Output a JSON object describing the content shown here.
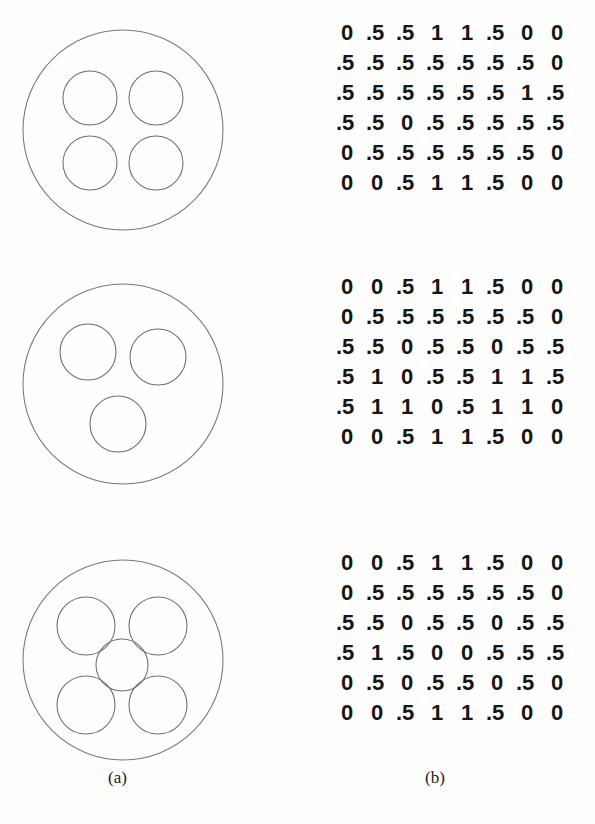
{
  "figure": {
    "caption_a": "(a)",
    "caption_b": "(b)",
    "stroke_color": "#6d6d70",
    "text_color": "#161616",
    "background": "#ffffff"
  },
  "panels": [
    {
      "id": "panel-1",
      "diagram": {
        "name": "four-circle-packing",
        "outer": {
          "cx": 105,
          "cy": 112,
          "r": 100
        },
        "inner": [
          {
            "cx": 72,
            "cy": 80,
            "r": 27
          },
          {
            "cx": 138,
            "cy": 80,
            "r": 27
          },
          {
            "cx": 72,
            "cy": 145,
            "r": 27
          },
          {
            "cx": 138,
            "cy": 145,
            "r": 27
          }
        ],
        "inner_count": 4
      },
      "matrix": [
        [
          "0",
          ".5",
          ".5",
          "1",
          "1",
          ".5",
          "0",
          "0"
        ],
        [
          ".5",
          ".5",
          ".5",
          ".5",
          ".5",
          ".5",
          ".5",
          "0"
        ],
        [
          ".5",
          ".5",
          ".5",
          ".5",
          ".5",
          ".5",
          "1",
          ".5"
        ],
        [
          ".5",
          ".5",
          "0",
          ".5",
          ".5",
          ".5",
          ".5",
          ".5"
        ],
        [
          "0",
          ".5",
          ".5",
          ".5",
          ".5",
          ".5",
          ".5",
          "0"
        ],
        [
          "0",
          "0",
          ".5",
          "1",
          "1",
          ".5",
          "0",
          "0"
        ]
      ]
    },
    {
      "id": "panel-2",
      "diagram": {
        "name": "three-circle-packing",
        "outer": {
          "cx": 105,
          "cy": 112,
          "r": 100
        },
        "inner": [
          {
            "cx": 70,
            "cy": 80,
            "r": 28
          },
          {
            "cx": 140,
            "cy": 85,
            "r": 28
          },
          {
            "cx": 100,
            "cy": 152,
            "r": 28
          }
        ],
        "inner_count": 3
      },
      "matrix": [
        [
          "0",
          "0",
          ".5",
          "1",
          "1",
          ".5",
          "0",
          "0"
        ],
        [
          "0",
          ".5",
          ".5",
          ".5",
          ".5",
          ".5",
          ".5",
          "0"
        ],
        [
          ".5",
          ".5",
          "0",
          ".5",
          ".5",
          "0",
          ".5",
          ".5"
        ],
        [
          ".5",
          "1",
          "0",
          ".5",
          ".5",
          "1",
          "1",
          ".5"
        ],
        [
          ".5",
          "1",
          "1",
          "0",
          ".5",
          "1",
          "1",
          "0"
        ],
        [
          "0",
          "0",
          ".5",
          "1",
          "1",
          ".5",
          "0",
          "0"
        ]
      ]
    },
    {
      "id": "panel-3",
      "diagram": {
        "name": "five-circle-packing",
        "outer": {
          "cx": 105,
          "cy": 112,
          "r": 100
        },
        "inner": [
          {
            "cx": 68,
            "cy": 78,
            "r": 29
          },
          {
            "cx": 140,
            "cy": 78,
            "r": 29
          },
          {
            "cx": 104,
            "cy": 117,
            "r": 26
          },
          {
            "cx": 68,
            "cy": 157,
            "r": 29
          },
          {
            "cx": 140,
            "cy": 157,
            "r": 29
          }
        ],
        "inner_count": 5
      },
      "matrix": [
        [
          "0",
          "0",
          ".5",
          "1",
          "1",
          ".5",
          "0",
          "0"
        ],
        [
          "0",
          ".5",
          ".5",
          ".5",
          ".5",
          ".5",
          ".5",
          "0"
        ],
        [
          ".5",
          ".5",
          "0",
          ".5",
          ".5",
          "0",
          ".5",
          ".5"
        ],
        [
          ".5",
          "1",
          ".5",
          "0",
          "0",
          ".5",
          ".5",
          ".5"
        ],
        [
          "0",
          ".5",
          "0",
          ".5",
          ".5",
          "0",
          ".5",
          "0"
        ],
        [
          "0",
          "0",
          ".5",
          "1",
          "1",
          ".5",
          "0",
          "0"
        ]
      ]
    }
  ]
}
